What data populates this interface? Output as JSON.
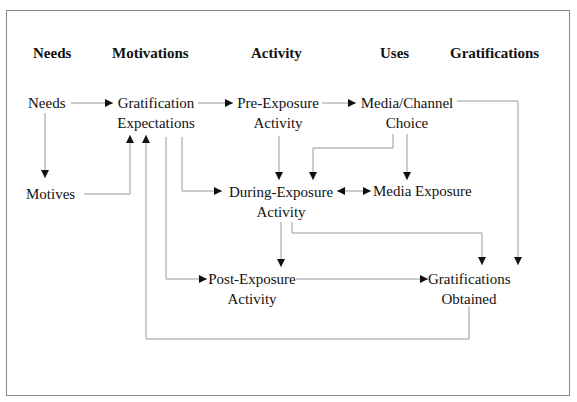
{
  "headers": {
    "needs": "Needs",
    "motivations": "Motivations",
    "activity": "Activity",
    "uses": "Uses",
    "gratifications": "Gratifications"
  },
  "nodes": {
    "needs": {
      "line1": "Needs"
    },
    "motives": {
      "line1": "Motives"
    },
    "gratification_expectations": {
      "line1": "Gratification",
      "line2": "Expectations"
    },
    "pre_exposure_activity": {
      "line1": "Pre-Exposure",
      "line2": "Activity"
    },
    "media_channel_choice": {
      "line1": "Media/Channel",
      "line2": "Choice"
    },
    "during_exposure_activity": {
      "line1": "During-Exposure",
      "line2": "Activity"
    },
    "media_exposure": {
      "line1": "Media Exposure"
    },
    "post_exposure_activity": {
      "line1": "Post-Exposure",
      "line2": "Activity"
    },
    "gratifications_obtained": {
      "line1": "Gratifications",
      "line2": "Obtained"
    }
  },
  "edges": [
    {
      "from": "Needs",
      "to": "Gratification Expectations"
    },
    {
      "from": "Needs",
      "to": "Motives"
    },
    {
      "from": "Motives",
      "to": "Gratification Expectations"
    },
    {
      "from": "Gratification Expectations",
      "to": "Pre-Exposure Activity"
    },
    {
      "from": "Pre-Exposure Activity",
      "to": "Media/Channel Choice"
    },
    {
      "from": "Pre-Exposure Activity",
      "to": "During-Exposure Activity"
    },
    {
      "from": "Media/Channel Choice",
      "to": "During-Exposure Activity"
    },
    {
      "from": "Media/Channel Choice",
      "to": "Media Exposure"
    },
    {
      "from": "Media/Channel Choice",
      "to": "Gratifications Obtained"
    },
    {
      "from": "Gratification Expectations",
      "to": "During-Exposure Activity"
    },
    {
      "from": "Gratification Expectations",
      "to": "Post-Exposure Activity"
    },
    {
      "from": "During-Exposure Activity",
      "to": "Media Exposure",
      "bidirectional": true
    },
    {
      "from": "During-Exposure Activity",
      "to": "Post-Exposure Activity"
    },
    {
      "from": "During-Exposure Activity",
      "to": "Gratifications Obtained"
    },
    {
      "from": "Post-Exposure Activity",
      "to": "Gratifications Obtained"
    },
    {
      "from": "Gratifications Obtained",
      "to": "Gratification Expectations"
    }
  ]
}
